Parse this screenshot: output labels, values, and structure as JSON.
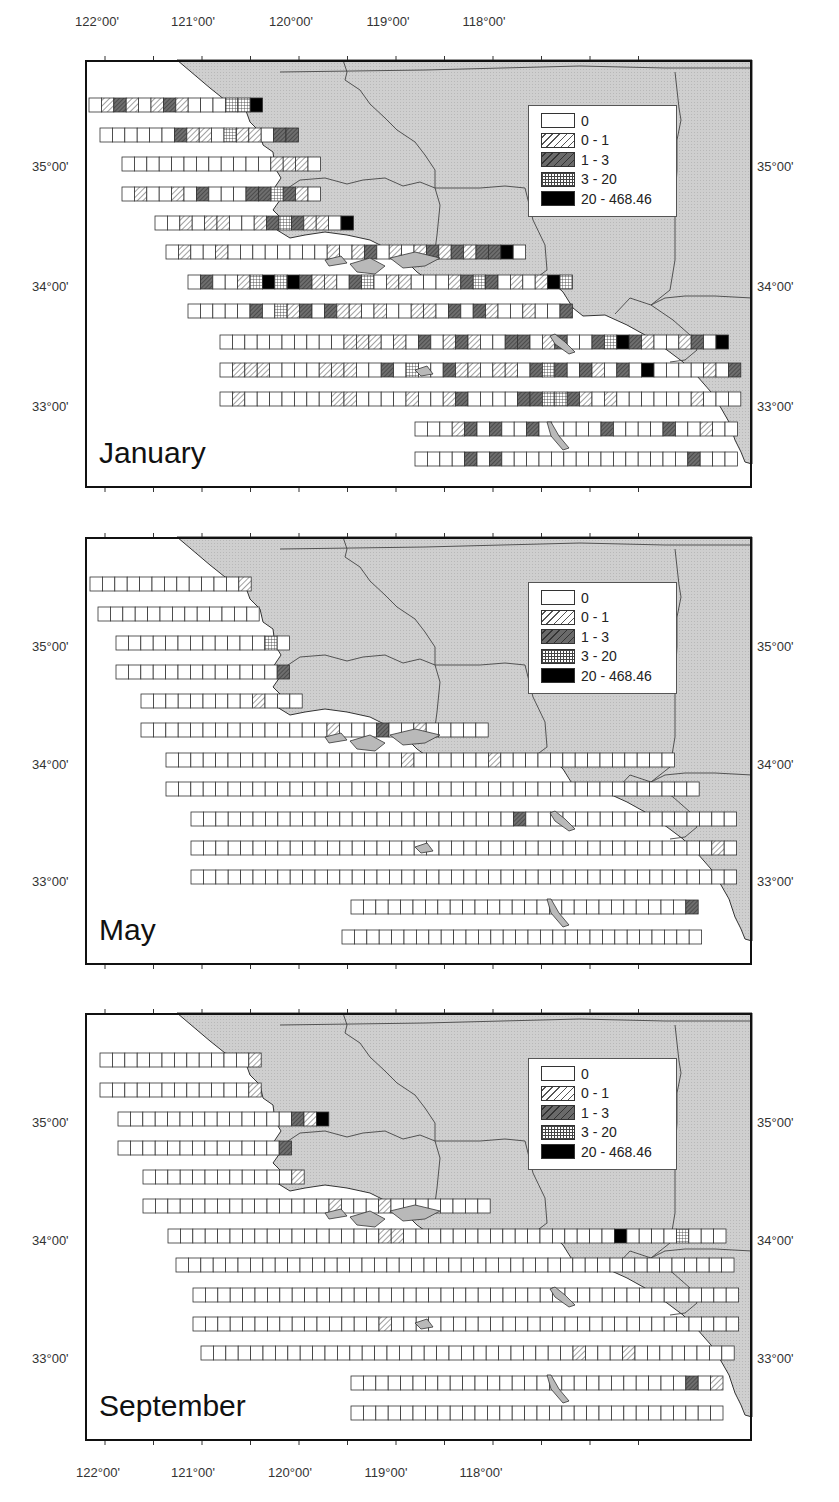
{
  "figure": {
    "top_axis": {
      "lon_labels": [
        {
          "text": "122°00'",
          "x": 97
        },
        {
          "text": "121°00'",
          "x": 194
        },
        {
          "text": "120°00'",
          "x": 291
        },
        {
          "text": "119°00'",
          "x": 388
        },
        {
          "text": "118°00'",
          "x": 485
        }
      ]
    },
    "bottom_axis": {
      "lon_labels": [
        {
          "text": "122°00'",
          "x": 100
        },
        {
          "text": "121°00'",
          "x": 196
        },
        {
          "text": "120°00'",
          "x": 292
        },
        {
          "text": "119°00'",
          "x": 388
        },
        {
          "text": "118°00'",
          "x": 485
        }
      ]
    },
    "lat_labels": [
      "35°00'",
      "34°00'",
      "33°00'"
    ]
  },
  "legend": {
    "items": [
      {
        "label": "0",
        "class": 0
      },
      {
        "label": "0 - 1",
        "class": 1
      },
      {
        "label": "1 - 3",
        "class": 2
      },
      {
        "label": "3 - 20",
        "class": 3
      },
      {
        "label": "20 - 468.46",
        "class": 4
      }
    ]
  },
  "panels": [
    {
      "month": "January",
      "top": 60,
      "lat_y": {
        "35": 107,
        "34": 227,
        "33": 347
      },
      "rows": [
        {
          "y": 38,
          "x0": 4,
          "cells": "01210121000334"
        },
        {
          "y": 68,
          "x0": 15,
          "cells": "0000002110311022"
        },
        {
          "y": 97,
          "x0": 37,
          "cells": "0000000000001110"
        },
        {
          "y": 127,
          "x0": 37,
          "cells": "0100102000223210"
        },
        {
          "y": 156,
          "x0": 70,
          "cells": "0010110012321104"
        },
        {
          "y": 185,
          "x0": 81,
          "cells": "01001000000001012010121212240"
        },
        {
          "y": 215,
          "x0": 103,
          "cells": "0200134342110230110001232010143"
        },
        {
          "y": 244,
          "x0": 103,
          "cells": "0000020312021101001102021001002"
        },
        {
          "y": 275,
          "x0": 135,
          "cells": "00000000001110102012100220120023421001204"
        },
        {
          "y": 303,
          "x0": 135,
          "cells": "0111000011100203002110110232021020400001024"
        },
        {
          "y": 332,
          "x0": 135,
          "cells": "0100000001100001001200002233210100000010002"
        },
        {
          "y": 362,
          "x0": 330,
          "cells": "0001202002000002000020010000100023"
        },
        {
          "y": 392,
          "x0": 330,
          "cells": "00002020000000000000002000020000"
        }
      ]
    },
    {
      "month": "May",
      "top": 537,
      "lat_y": {
        "35": 110,
        "34": 228,
        "33": 345
      },
      "rows": [
        {
          "y": 40,
          "x0": 5,
          "cells": "0000000000001"
        },
        {
          "y": 70,
          "x0": 13,
          "cells": "0000000000000"
        },
        {
          "y": 99,
          "x0": 31,
          "cells": "00000000000030"
        },
        {
          "y": 128,
          "x0": 31,
          "cells": "00000000000002"
        },
        {
          "y": 157,
          "x0": 56,
          "cells": "0000000001000"
        },
        {
          "y": 186,
          "x0": 56,
          "cells": "0000000000000001000200100000"
        },
        {
          "y": 216,
          "x0": 81,
          "cells": "00000000000000000001000000100000000000000"
        },
        {
          "y": 245,
          "x0": 81,
          "cells": "0000000000000000000000000000000000000000000"
        },
        {
          "y": 275,
          "x0": 106,
          "cells": "000000000000000000000000002000000000000000000"
        },
        {
          "y": 304,
          "x0": 106,
          "cells": "000000000000000000000000000000000000000000100"
        },
        {
          "y": 333,
          "x0": 106,
          "cells": "00000000000000000000000000000000000000000000000"
        },
        {
          "y": 363,
          "x0": 266,
          "cells": "0000000000000000000000000002"
        },
        {
          "y": 393,
          "x0": 257,
          "cells": "00000000000000000000000000000"
        }
      ]
    },
    {
      "month": "September",
      "top": 1013,
      "lat_y": {
        "35": 110,
        "34": 228,
        "33": 346
      },
      "rows": [
        {
          "y": 40,
          "x0": 15,
          "cells": "0000000000001"
        },
        {
          "y": 70,
          "x0": 15,
          "cells": "0000000000001"
        },
        {
          "y": 99,
          "x0": 33,
          "cells": "00000000000000214"
        },
        {
          "y": 128,
          "x0": 33,
          "cells": "00000000000002"
        },
        {
          "y": 157,
          "x0": 58,
          "cells": "0000000000001"
        },
        {
          "y": 186,
          "x0": 58,
          "cells": "0000000000000001000100000000"
        },
        {
          "y": 216,
          "x0": 83,
          "cells": "000000000000000001100000000000000000400003000"
        },
        {
          "y": 245,
          "x0": 91,
          "cells": "000000000000000000000000000000000000000000000"
        },
        {
          "y": 275,
          "x0": 108,
          "cells": "000000000000000000000000000000000000000000000003"
        },
        {
          "y": 304,
          "x0": 108,
          "cells": "0000000000000001000000000000000000000000000000"
        },
        {
          "y": 333,
          "x0": 116,
          "cells": "0000000000000000000000000000001000100000000000"
        },
        {
          "y": 363,
          "x0": 266,
          "cells": "000000000000000000000000000201"
        },
        {
          "y": 393,
          "x0": 266,
          "cells": "000000000000000000000000000000"
        }
      ]
    }
  ],
  "chart_data": {
    "type": "heatmap",
    "panels": [
      "January",
      "May",
      "September"
    ],
    "xlabel": "Longitude (W)",
    "ylabel": "Latitude (N)",
    "x_ticks": [
      "122°00'",
      "121°00'",
      "120°00'",
      "119°00'",
      "118°00'"
    ],
    "y_ticks": [
      "35°00'",
      "34°00'",
      "33°00'"
    ],
    "xlim": [
      "122°10'W",
      "117°05'W"
    ],
    "ylim": [
      "32°30'N",
      "35°45'N"
    ],
    "legend": [
      "0",
      "0 - 1",
      "1 - 3",
      "3 - 20",
      "20 - 468.46"
    ],
    "legend_position": "upper right (over land)",
    "class_counts_estimate": {
      "January": {
        "0": "majority",
        "0 - 1": "many",
        "1 - 3": "many",
        "3 - 20": "some",
        "20 - 468.46": "~20 cells along coast"
      },
      "May": {
        "0": "nearly all",
        "0 - 1": "few",
        "1 - 3": "few",
        "3 - 20": "few",
        "20 - 468.46": "~1"
      },
      "September": {
        "0": "nearly all",
        "0 - 1": "some",
        "1 - 3": "few",
        "3 - 20": "few",
        "20 - 468.46": "~3"
      }
    }
  }
}
